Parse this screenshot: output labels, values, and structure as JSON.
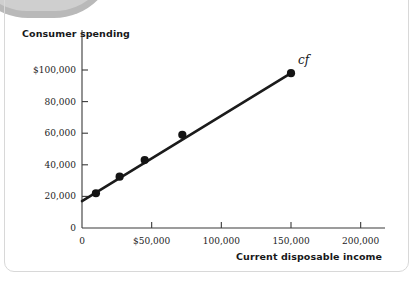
{
  "figure": {
    "decoration": {
      "arc_color_outer": "#b9b9b9",
      "arc_color_inner": "#cfcfcf",
      "frame_color": "#d8d8d8"
    }
  },
  "chart_data": {
    "type": "line",
    "title": "",
    "subtitle": "",
    "xlabel": "Current disposable income",
    "ylabel": "Consumer spending",
    "grid": false,
    "legend": "none",
    "series_annotation": "cf",
    "xlim": [
      0,
      212000
    ],
    "ylim": [
      0,
      112000
    ],
    "xticks": [
      0,
      50000,
      100000,
      150000,
      200000
    ],
    "xtick_labels": [
      "0",
      "$50,000",
      "100,000",
      "150,000",
      "200,000"
    ],
    "yticks": [
      0,
      20000,
      40000,
      60000,
      80000,
      100000
    ],
    "ytick_labels": [
      "0",
      "20,000",
      "40,000",
      "60,000",
      "80,000",
      "$100,000"
    ],
    "line": {
      "name": "cf",
      "color": "#1b1b1b",
      "width": 2.6,
      "intercept": 17000,
      "slope": 0.54,
      "x_start": 0,
      "x_end": 150000
    },
    "points": [
      {
        "x": 10000,
        "y": 22000
      },
      {
        "x": 27000,
        "y": 32500
      },
      {
        "x": 45000,
        "y": 43000
      },
      {
        "x": 72000,
        "y": 59000
      },
      {
        "x": 150000,
        "y": 98000
      }
    ],
    "point_color": "#141414",
    "axis_color": "#3a3a3a"
  }
}
